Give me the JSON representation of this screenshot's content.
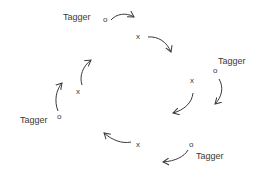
{
  "diagram": {
    "colors": {
      "ink": "#3a3a3a",
      "background": "#ffffff"
    },
    "taggers": [
      {
        "label": "Tagger",
        "marker": "o"
      },
      {
        "label": "Tagger",
        "marker": "o"
      },
      {
        "label": "Tagger",
        "marker": "o"
      },
      {
        "label": "Tagger",
        "marker": "o"
      }
    ],
    "players": [
      {
        "marker": "x"
      },
      {
        "marker": "x"
      },
      {
        "marker": "x"
      },
      {
        "marker": "x"
      }
    ],
    "flow_direction": "clockwise"
  }
}
